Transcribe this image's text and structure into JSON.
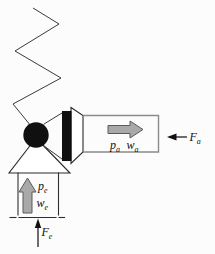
{
  "labels": {
    "output_pressure": {
      "symbol": "p",
      "subscript": "a"
    },
    "output_flow": {
      "symbol": "w",
      "subscript": "a"
    },
    "output_force": {
      "symbol": "F",
      "subscript": "a"
    },
    "input_pressure": {
      "symbol": "p",
      "subscript": "e"
    },
    "input_flow": {
      "symbol": "w",
      "subscript": "e"
    },
    "input_force": {
      "symbol": "F",
      "subscript": "e"
    }
  },
  "colors": {
    "background": "#fcfcfc",
    "ink": "#101010",
    "channel_outline_gray": "#8a8a8a",
    "block_arrow_fill": "#a9a9a9",
    "block_arrow_stroke": "#5a5a5a"
  }
}
